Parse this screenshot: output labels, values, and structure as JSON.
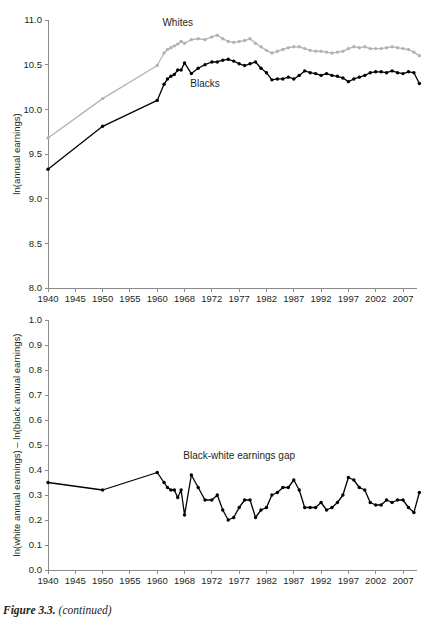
{
  "figure": {
    "caption_label": "Figure 3.3.",
    "caption_note": "(continued)"
  },
  "colors": {
    "black_series": "#000000",
    "gray_series": "#b3b3b3",
    "axis": "#8a8a8a",
    "text": "#231f20",
    "background": "#ffffff"
  },
  "chart_data": [
    {
      "type": "line",
      "panel": "top",
      "title": "",
      "xlabel": "",
      "ylabel": "ln(annual earnings)",
      "ylim": [
        8.0,
        11.0
      ],
      "ytick_labels": [
        "8.0",
        "8.5",
        "9.0",
        "9.5",
        "10.0",
        "10.5",
        "11.0"
      ],
      "ytick_values": [
        8.0,
        8.5,
        9.0,
        9.5,
        10.0,
        10.5,
        11.0
      ],
      "xtick_labels": [
        "1940",
        "1945",
        "1950",
        "1955",
        "1960",
        "1968",
        "1972",
        "1977",
        "1982",
        "1987",
        "1992",
        "1997",
        "2002",
        "2007"
      ],
      "xtick_values": [
        1940,
        1945,
        1950,
        1955,
        1960,
        1968,
        1972,
        1977,
        1982,
        1987,
        1992,
        1997,
        2002,
        2007
      ],
      "grid": false,
      "legend": "inline-annotations",
      "annotations": [
        {
          "text": "Whites",
          "x": 1966,
          "y": 10.93
        },
        {
          "text": "Blacks",
          "x": 1971,
          "y": 10.25
        }
      ],
      "x": [
        1940,
        1950,
        1960,
        1962,
        1963,
        1964,
        1965,
        1966,
        1967,
        1968,
        1969,
        1970,
        1971,
        1972,
        1973,
        1974,
        1975,
        1976,
        1977,
        1978,
        1979,
        1980,
        1981,
        1982,
        1983,
        1984,
        1985,
        1986,
        1987,
        1988,
        1989,
        1990,
        1991,
        1992,
        1993,
        1994,
        1995,
        1996,
        1997,
        1998,
        1999,
        2000,
        2001,
        2002,
        2003,
        2004,
        2005,
        2006,
        2007,
        2008,
        2009,
        2010
      ],
      "series": [
        {
          "name": "Whites",
          "color": "#b3b3b3",
          "values": [
            9.68,
            10.12,
            10.49,
            10.63,
            10.67,
            10.69,
            10.71,
            10.73,
            10.76,
            10.74,
            10.78,
            10.79,
            10.78,
            10.81,
            10.83,
            10.79,
            10.76,
            10.75,
            10.76,
            10.77,
            10.79,
            10.74,
            10.7,
            10.66,
            10.63,
            10.65,
            10.67,
            10.69,
            10.7,
            10.7,
            10.68,
            10.66,
            10.65,
            10.65,
            10.64,
            10.63,
            10.64,
            10.65,
            10.68,
            10.7,
            10.69,
            10.7,
            10.68,
            10.68,
            10.68,
            10.69,
            10.7,
            10.69,
            10.68,
            10.67,
            10.64,
            10.6
          ]
        },
        {
          "name": "Blacks",
          "color": "#000000",
          "values": [
            9.33,
            9.81,
            10.1,
            10.28,
            10.34,
            10.37,
            10.39,
            10.44,
            10.44,
            10.52,
            10.4,
            10.46,
            10.5,
            10.53,
            10.53,
            10.55,
            10.56,
            10.54,
            10.51,
            10.49,
            10.51,
            10.53,
            10.46,
            10.41,
            10.33,
            10.34,
            10.34,
            10.36,
            10.34,
            10.38,
            10.43,
            10.41,
            10.4,
            10.38,
            10.4,
            10.38,
            10.37,
            10.35,
            10.31,
            10.34,
            10.36,
            10.38,
            10.41,
            10.42,
            10.42,
            10.41,
            10.43,
            10.41,
            10.4,
            10.42,
            10.41,
            10.29
          ]
        }
      ]
    },
    {
      "type": "line",
      "panel": "bottom",
      "title": "",
      "xlabel": "",
      "ylabel": "ln(white annual earnings) – ln(black annual earnings)",
      "ylim": [
        0.0,
        1.0
      ],
      "ytick_labels": [
        "0.0",
        "0.1",
        "0.2",
        "0.3",
        "0.4",
        "0.5",
        "0.6",
        "0.7",
        "0.8",
        "0.9",
        "1.0"
      ],
      "ytick_values": [
        0.0,
        0.1,
        0.2,
        0.3,
        0.4,
        0.5,
        0.6,
        0.7,
        0.8,
        0.9,
        1.0
      ],
      "xtick_labels": [
        "1940",
        "1945",
        "1950",
        "1955",
        "1960",
        "1968",
        "1972",
        "1977",
        "1982",
        "1987",
        "1992",
        "1997",
        "2002",
        "2007"
      ],
      "xtick_values": [
        1940,
        1945,
        1950,
        1955,
        1960,
        1968,
        1972,
        1977,
        1982,
        1987,
        1992,
        1997,
        2002,
        2007
      ],
      "grid": false,
      "legend": "inline-annotations",
      "annotations": [
        {
          "text": "Black-white earnings gap",
          "x": 1977,
          "y": 0.445
        }
      ],
      "x": [
        1940,
        1950,
        1960,
        1962,
        1963,
        1964,
        1965,
        1966,
        1967,
        1968,
        1969,
        1970,
        1971,
        1972,
        1973,
        1974,
        1975,
        1976,
        1977,
        1978,
        1979,
        1980,
        1981,
        1982,
        1983,
        1984,
        1985,
        1986,
        1987,
        1988,
        1989,
        1990,
        1991,
        1992,
        1993,
        1994,
        1995,
        1996,
        1997,
        1998,
        1999,
        2000,
        2001,
        2002,
        2003,
        2004,
        2005,
        2006,
        2007,
        2008,
        2009,
        2010
      ],
      "series": [
        {
          "name": "Black-white earnings gap",
          "color": "#000000",
          "values": [
            0.35,
            0.32,
            0.39,
            0.35,
            0.33,
            0.32,
            0.32,
            0.29,
            0.32,
            0.22,
            0.38,
            0.33,
            0.28,
            0.28,
            0.3,
            0.24,
            0.2,
            0.21,
            0.25,
            0.28,
            0.28,
            0.21,
            0.24,
            0.25,
            0.3,
            0.31,
            0.33,
            0.33,
            0.36,
            0.32,
            0.25,
            0.25,
            0.25,
            0.27,
            0.24,
            0.25,
            0.27,
            0.3,
            0.37,
            0.36,
            0.33,
            0.32,
            0.27,
            0.26,
            0.26,
            0.28,
            0.27,
            0.28,
            0.28,
            0.25,
            0.23,
            0.31
          ]
        }
      ]
    }
  ]
}
